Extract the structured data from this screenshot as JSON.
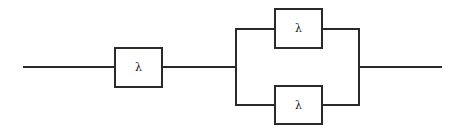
{
  "diagram": {
    "type": "reliability-block-diagram",
    "line_color": "#2a2a2a",
    "background": "#ffffff",
    "blocks": [
      {
        "id": "series-block",
        "label": "λ"
      },
      {
        "id": "parallel-top-block",
        "label": "λ"
      },
      {
        "id": "parallel-bottom-block",
        "label": "λ"
      }
    ]
  }
}
